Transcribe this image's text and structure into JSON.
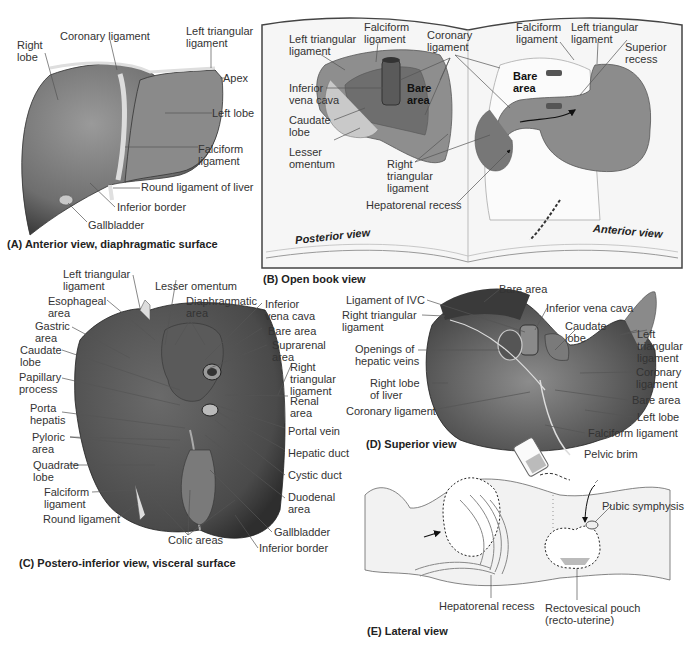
{
  "colors": {
    "liver_dark": "#5a5a5a",
    "liver_mid": "#8a8a8a",
    "liver_light": "#b5b5b5",
    "ligament": "#d8d8d8",
    "book_bg": "#f6f6f6",
    "book_border": "#444444",
    "leader": "#444444"
  },
  "panel_a": {
    "caption": "(A) Anterior view, diaphragmatic surface",
    "labels": {
      "right_lobe": "Right\nlobe",
      "coronary_ligament": "Coronary ligament",
      "left_triangular_ligament": "Left triangular\nligament",
      "apex": "Apex",
      "left_lobe": "Left lobe",
      "falciform_ligament": "Falciform\nligament",
      "round_ligament": "Round ligament of liver",
      "inferior_border": "Inferior border",
      "gallbladder": "Gallbladder"
    }
  },
  "panel_b": {
    "caption": "(B) Open book view",
    "posterior_view": "Posterior view",
    "anterior_view": "Anterior view",
    "labels": {
      "left_triangular_ligament_l": "Left triangular\nligament",
      "falciform_ligament_l": "Falciform\nligament",
      "coronary_ligament": "Coronary\nligament",
      "inferior_vena_cava": "Inferior\nvena cava",
      "bare_area_l": "Bare\narea",
      "caudate_lobe": "Caudate\nlobe",
      "lesser_omentum": "Lesser\nomentum",
      "right_triangular_ligament": "Right\ntriangular\nligament",
      "hepatorenal_recess": "Hepatorenal recess",
      "falciform_ligament_r": "Falciform\nligament",
      "left_triangular_ligament_r": "Left triangular\nligament",
      "superior_recess": "Superior\nrecess",
      "bare_area_r": "Bare\narea"
    }
  },
  "panel_c": {
    "caption": "(C) Postero-inferior view, visceral surface",
    "labels": {
      "left_triangular_ligament": "Left triangular\nligament",
      "esophageal_area": "Esophageal\narea",
      "gastric_area": "Gastric\narea",
      "caudate_lobe": "Caudate\nlobe",
      "papillary_process": "Papillary\nprocess",
      "porta_hepatis": "Porta\nhepatis",
      "pyloric_area": "Pyloric\narea",
      "quadrate_lobe": "Quadrate\nlobe",
      "falciform_ligament": "Falciform\nligament",
      "round_ligament": "Round ligament",
      "lesser_omentum": "Lesser omentum",
      "diaphragmatic_area": "Diaphragmatic\narea",
      "inferior_vena_cava": "Inferior\nvena cava",
      "bare_area": "Bare area",
      "suprarenal_area": "Suprarenal\narea",
      "right_triangular_ligament": "Right\ntriangular\nligament",
      "renal_area": "Renal\narea",
      "portal_vein": "Portal vein",
      "hepatic_duct": "Hepatic duct",
      "cystic_duct": "Cystic duct",
      "duodenal_area": "Duodenal\narea",
      "gallbladder": "Gallbladder",
      "inferior_border": "Inferior border",
      "colic_areas": "Colic areas"
    }
  },
  "panel_d": {
    "caption": "(D) Superior view",
    "labels": {
      "bare_area_top": "Bare area",
      "ligament_ivc": "Ligament of IVC",
      "right_triangular_ligament": "Right triangular\nligament",
      "inferior_vena_cava": "Inferior vena cava",
      "caudate_lobe": "Caudate\nlobe",
      "left_triangular_ligament": "Left\ntriangular\nligament",
      "openings_hepatic_veins": "Openings of\nhepatic veins",
      "right_lobe": "Right lobe\nof liver",
      "coronary_ligament_left": "Coronary ligament",
      "coronary_ligament_right": "Coronary\nligament",
      "bare_area": "Bare area",
      "left_lobe": "Left lobe",
      "falciform_ligament": "Falciform ligament"
    }
  },
  "panel_e": {
    "caption": "(E) Lateral view",
    "labels": {
      "pelvic_brim": "Pelvic brim",
      "pubic_symphysis": "Pubic symphysis",
      "hepatorenal_recess": "Hepatorenal recess",
      "rectovesical_pouch": "Rectovesical pouch\n(recto-uterine)"
    }
  }
}
